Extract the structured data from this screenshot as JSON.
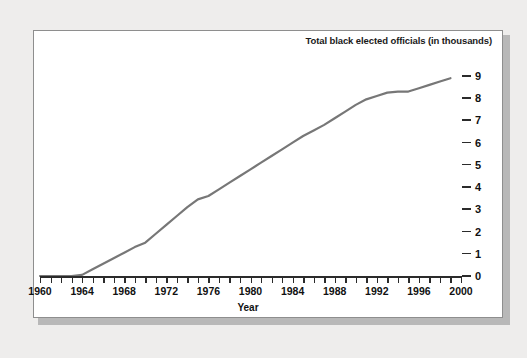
{
  "chart_data": {
    "type": "line",
    "title": "Total black elected officials (in thousands)",
    "xlabel": "Year",
    "ylabel": "",
    "xlim": [
      1960,
      2000
    ],
    "ylim": [
      0,
      9
    ],
    "grid": false,
    "legend": "none",
    "x_tick_labels": [
      "1960",
      "1964",
      "1968",
      "1972",
      "1976",
      "1980",
      "1984",
      "1988",
      "1992",
      "1996",
      "2000"
    ],
    "x_tick_values": [
      1960,
      1964,
      1968,
      1972,
      1976,
      1980,
      1984,
      1988,
      1992,
      1996,
      2000
    ],
    "x_minor_tick_step": 1,
    "y_tick_labels": [
      "0",
      "1",
      "2",
      "3",
      "4",
      "5",
      "6",
      "7",
      "8",
      "9"
    ],
    "y_tick_values": [
      0,
      1,
      2,
      3,
      4,
      5,
      6,
      7,
      8,
      9
    ],
    "series": [
      {
        "name": "Total black elected officials (in thousands)",
        "color": "#777777",
        "x": [
          1960,
          1961,
          1962,
          1963,
          1964,
          1965,
          1966,
          1967,
          1968,
          1969,
          1970,
          1971,
          1972,
          1973,
          1974,
          1975,
          1976,
          1977,
          1978,
          1979,
          1980,
          1981,
          1982,
          1983,
          1984,
          1985,
          1986,
          1987,
          1988,
          1989,
          1990,
          1991,
          1992,
          1993,
          1994,
          1995,
          1996,
          1997,
          1998,
          1999
        ],
        "values": [
          0.0,
          0.0,
          0.0,
          0.0,
          0.05,
          0.3,
          0.55,
          0.8,
          1.05,
          1.3,
          1.5,
          1.9,
          2.3,
          2.7,
          3.1,
          3.45,
          3.6,
          3.9,
          4.2,
          4.5,
          4.8,
          5.1,
          5.4,
          5.7,
          6.0,
          6.3,
          6.55,
          6.8,
          7.1,
          7.4,
          7.7,
          7.95,
          8.1,
          8.25,
          8.3,
          8.3,
          8.45,
          8.6,
          8.75,
          8.9
        ],
        "marker": "none",
        "line_width": 2.2
      }
    ]
  },
  "figure": {
    "background_color": "#eeedec",
    "panel_background_color": "#ffffff",
    "panel_border_color": "#8e8e8e",
    "axis_color": "#2b2b2b",
    "text_color": "#111111"
  }
}
